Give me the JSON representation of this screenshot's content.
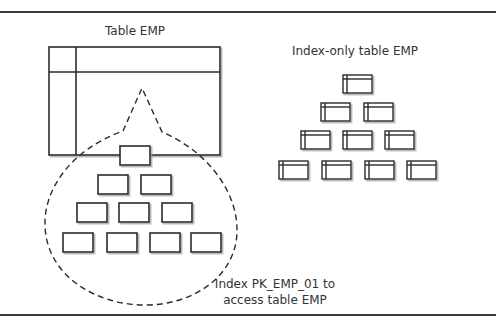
{
  "labels": {
    "table_emp": "Table EMP",
    "index_only_table": "Index-only table EMP",
    "index_caption_line1": "Index PK_EMP_01 to",
    "index_caption_line2": "access table EMP"
  },
  "colors": {
    "stroke": "#2b2b2b",
    "shadow": "#bdbdbd",
    "text": "#333333",
    "background": "#ffffff"
  },
  "diagram": {
    "left": {
      "title": "Table EMP",
      "table": {
        "x": 49,
        "y": 47,
        "w": 171,
        "h": 108,
        "header_line_y": 72,
        "key_column_x": 76
      },
      "index_tree_rows": [
        [
          {
            "x": 120,
            "y": 146
          }
        ],
        [
          {
            "x": 98,
            "y": 175
          },
          {
            "x": 141,
            "y": 175
          }
        ],
        [
          {
            "x": 77,
            "y": 203
          },
          {
            "x": 119,
            "y": 203
          },
          {
            "x": 162,
            "y": 203
          }
        ],
        [
          {
            "x": 63,
            "y": 233
          },
          {
            "x": 107,
            "y": 233
          },
          {
            "x": 150,
            "y": 233
          },
          {
            "x": 191,
            "y": 233
          }
        ]
      ],
      "caption": [
        "Index PK_EMP_01 to",
        "access table EMP"
      ]
    },
    "right": {
      "title": "Index-only table EMP",
      "tree_rows": [
        [
          {
            "x": 343,
            "y": 75
          }
        ],
        [
          {
            "x": 321,
            "y": 103
          },
          {
            "x": 364,
            "y": 103
          }
        ],
        [
          {
            "x": 301,
            "y": 131
          },
          {
            "x": 343,
            "y": 131
          },
          {
            "x": 385,
            "y": 131
          }
        ],
        [
          {
            "x": 279,
            "y": 160
          },
          {
            "x": 322,
            "y": 160
          },
          {
            "x": 365,
            "y": 160
          },
          {
            "x": 407,
            "y": 160
          }
        ]
      ]
    }
  }
}
